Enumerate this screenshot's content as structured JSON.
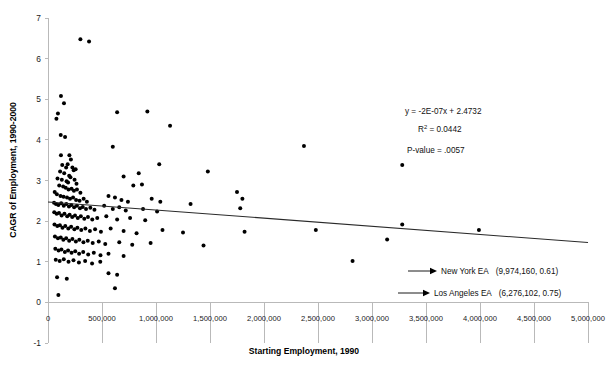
{
  "chart_data": {
    "type": "scatter",
    "title": "",
    "xlabel": "Starting Employment, 1990",
    "ylabel": "CAGR of Employment, 1990-2000",
    "xlim": [
      0,
      5000000
    ],
    "ylim": [
      -1,
      7
    ],
    "xticks": [
      0,
      500000,
      1000000,
      1500000,
      2000000,
      2500000,
      3000000,
      3500000,
      4000000,
      4500000,
      5000000
    ],
    "xtick_labels": [
      "0",
      "500,000",
      "1,000,000",
      "1,500,000",
      "2,000,000",
      "2,500,000",
      "3,000,000",
      "3,500,000",
      "4,000,000",
      "4,500,000",
      "5,000,000"
    ],
    "yticks": [
      -1,
      0,
      1,
      2,
      3,
      4,
      5,
      6,
      7
    ],
    "ytick_labels": [
      "-1",
      "0",
      "1",
      "2",
      "3",
      "4",
      "5",
      "6",
      "7"
    ],
    "grid": false,
    "legend": "none",
    "marker_color": "#000000",
    "trendline_color": "#2a2a2a",
    "axis_color": "#b9b9b9",
    "trendline": {
      "slope": -2e-07,
      "intercept": 2.4732,
      "x_start": 0,
      "x_end": 5000000,
      "y_start": 2.4732,
      "y_end": 1.4732
    },
    "points": [
      [
        300000,
        6.48
      ],
      [
        380000,
        6.42
      ],
      [
        120000,
        5.08
      ],
      [
        148000,
        4.9
      ],
      [
        92000,
        4.65
      ],
      [
        78000,
        4.52
      ],
      [
        640000,
        4.68
      ],
      [
        920000,
        4.7
      ],
      [
        1130000,
        4.35
      ],
      [
        118000,
        4.12
      ],
      [
        158000,
        4.07
      ],
      [
        600000,
        3.83
      ],
      [
        2370000,
        3.85
      ],
      [
        120000,
        3.62
      ],
      [
        198000,
        3.62
      ],
      [
        212000,
        3.52
      ],
      [
        3280000,
        3.38
      ],
      [
        1030000,
        3.4
      ],
      [
        132000,
        3.38
      ],
      [
        168000,
        3.32
      ],
      [
        182000,
        3.4
      ],
      [
        226000,
        3.32
      ],
      [
        238000,
        3.25
      ],
      [
        256000,
        3.28
      ],
      [
        112000,
        3.22
      ],
      [
        150000,
        3.18
      ],
      [
        196000,
        3.12
      ],
      [
        208000,
        3.08
      ],
      [
        88000,
        3.05
      ],
      [
        128000,
        3.02
      ],
      [
        172000,
        2.98
      ],
      [
        186000,
        2.95
      ],
      [
        246000,
        3.02
      ],
      [
        264000,
        2.92
      ],
      [
        700000,
        3.1
      ],
      [
        840000,
        3.18
      ],
      [
        790000,
        2.88
      ],
      [
        870000,
        2.9
      ],
      [
        1480000,
        3.22
      ],
      [
        104000,
        2.88
      ],
      [
        140000,
        2.85
      ],
      [
        164000,
        2.82
      ],
      [
        190000,
        2.78
      ],
      [
        218000,
        2.8
      ],
      [
        240000,
        2.75
      ],
      [
        268000,
        2.78
      ],
      [
        300000,
        2.7
      ],
      [
        62000,
        2.72
      ],
      [
        82000,
        2.66
      ],
      [
        116000,
        2.62
      ],
      [
        144000,
        2.6
      ],
      [
        176000,
        2.58
      ],
      [
        204000,
        2.55
      ],
      [
        232000,
        2.58
      ],
      [
        260000,
        2.52
      ],
      [
        292000,
        2.5
      ],
      [
        330000,
        2.55
      ],
      [
        360000,
        2.48
      ],
      [
        560000,
        2.62
      ],
      [
        620000,
        2.58
      ],
      [
        680000,
        2.52
      ],
      [
        740000,
        2.48
      ],
      [
        960000,
        2.55
      ],
      [
        1040000,
        2.48
      ],
      [
        1750000,
        2.72
      ],
      [
        1800000,
        2.55
      ],
      [
        56000,
        2.45
      ],
      [
        74000,
        2.42
      ],
      [
        96000,
        2.4
      ],
      [
        122000,
        2.44
      ],
      [
        146000,
        2.38
      ],
      [
        170000,
        2.42
      ],
      [
        194000,
        2.36
      ],
      [
        216000,
        2.4
      ],
      [
        242000,
        2.34
      ],
      [
        268000,
        2.38
      ],
      [
        296000,
        2.32
      ],
      [
        322000,
        2.35
      ],
      [
        352000,
        2.3
      ],
      [
        392000,
        2.33
      ],
      [
        430000,
        2.28
      ],
      [
        520000,
        2.38
      ],
      [
        600000,
        2.3
      ],
      [
        660000,
        2.34
      ],
      [
        720000,
        2.26
      ],
      [
        880000,
        2.3
      ],
      [
        1010000,
        2.24
      ],
      [
        1320000,
        2.42
      ],
      [
        1780000,
        2.32
      ],
      [
        58000,
        2.22
      ],
      [
        80000,
        2.18
      ],
      [
        102000,
        2.2
      ],
      [
        126000,
        2.14
      ],
      [
        152000,
        2.18
      ],
      [
        178000,
        2.12
      ],
      [
        200000,
        2.16
      ],
      [
        224000,
        2.1
      ],
      [
        250000,
        2.14
      ],
      [
        276000,
        2.08
      ],
      [
        304000,
        2.12
      ],
      [
        336000,
        2.06
      ],
      [
        370000,
        2.1
      ],
      [
        410000,
        2.04
      ],
      [
        456000,
        2.08
      ],
      [
        540000,
        2.12
      ],
      [
        640000,
        2.04
      ],
      [
        760000,
        2.08
      ],
      [
        900000,
        2.02
      ],
      [
        60000,
        1.92
      ],
      [
        86000,
        1.88
      ],
      [
        110000,
        1.9
      ],
      [
        134000,
        1.84
      ],
      [
        160000,
        1.88
      ],
      [
        188000,
        1.82
      ],
      [
        214000,
        1.86
      ],
      [
        244000,
        1.8
      ],
      [
        272000,
        1.84
      ],
      [
        308000,
        1.78
      ],
      [
        346000,
        1.82
      ],
      [
        388000,
        1.76
      ],
      [
        436000,
        1.8
      ],
      [
        490000,
        1.74
      ],
      [
        580000,
        1.82
      ],
      [
        700000,
        1.76
      ],
      [
        820000,
        1.7
      ],
      [
        1060000,
        1.78
      ],
      [
        1250000,
        1.72
      ],
      [
        1820000,
        1.74
      ],
      [
        2480000,
        1.78
      ],
      [
        3140000,
        1.55
      ],
      [
        3280000,
        1.92
      ],
      [
        3990000,
        1.78
      ],
      [
        64000,
        1.62
      ],
      [
        92000,
        1.58
      ],
      [
        118000,
        1.6
      ],
      [
        142000,
        1.54
      ],
      [
        168000,
        1.58
      ],
      [
        196000,
        1.52
      ],
      [
        226000,
        1.56
      ],
      [
        258000,
        1.5
      ],
      [
        290000,
        1.54
      ],
      [
        328000,
        1.48
      ],
      [
        368000,
        1.52
      ],
      [
        414000,
        1.46
      ],
      [
        470000,
        1.5
      ],
      [
        530000,
        1.44
      ],
      [
        660000,
        1.48
      ],
      [
        780000,
        1.42
      ],
      [
        950000,
        1.46
      ],
      [
        1440000,
        1.4
      ],
      [
        68000,
        1.32
      ],
      [
        98000,
        1.28
      ],
      [
        124000,
        1.3
      ],
      [
        156000,
        1.24
      ],
      [
        186000,
        1.28
      ],
      [
        218000,
        1.22
      ],
      [
        252000,
        1.26
      ],
      [
        288000,
        1.2
      ],
      [
        326000,
        1.24
      ],
      [
        372000,
        1.18
      ],
      [
        424000,
        1.22
      ],
      [
        486000,
        1.16
      ],
      [
        560000,
        1.2
      ],
      [
        700000,
        1.14
      ],
      [
        2820000,
        1.02
      ],
      [
        72000,
        1.05
      ],
      [
        108000,
        1.02
      ],
      [
        146000,
        1.06
      ],
      [
        190000,
        1.0
      ],
      [
        236000,
        1.04
      ],
      [
        286000,
        0.98
      ],
      [
        344000,
        1.02
      ],
      [
        408000,
        0.96
      ],
      [
        484000,
        1.0
      ],
      [
        560000,
        0.72
      ],
      [
        640000,
        0.68
      ],
      [
        84000,
        0.62
      ],
      [
        174000,
        0.58
      ],
      [
        620000,
        0.35
      ],
      [
        96000,
        0.18
      ]
    ],
    "annotations": [
      {
        "label": "New York EA",
        "value": "(9,974,160, 0.61)",
        "x_value": 9974160,
        "y_value": 0.61
      },
      {
        "label": "Los Angeles EA",
        "value": "(6,276,102, 0.75)",
        "x_value": 6276102,
        "y_value": 0.75
      }
    ],
    "stats": {
      "equation": "y = -2E-07x + 2.4732",
      "r_squared_prefix": "R",
      "r_squared_exp": "2",
      "r_squared_value": " = 0.0442",
      "p_value": "P-value = .0057"
    }
  }
}
